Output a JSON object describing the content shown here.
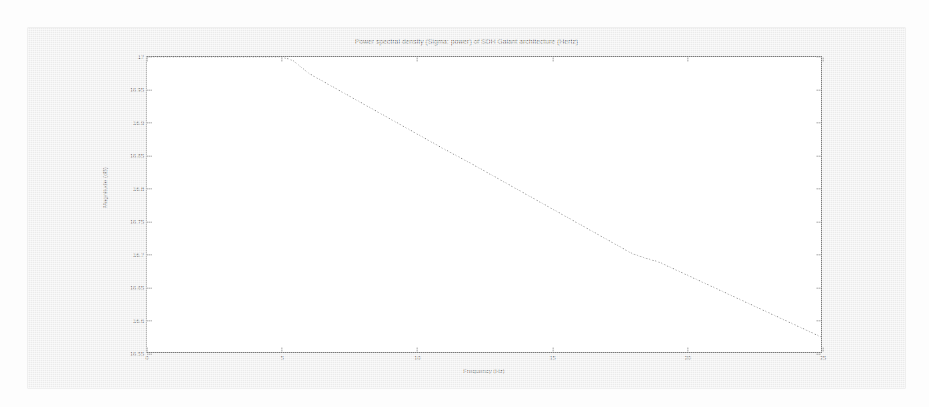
{
  "window": {
    "background_color": "#ffffff",
    "figure_background_color": "#ebebeb",
    "axes_background_color": "#ffffff",
    "axes_border_color": "#7a7a7a"
  },
  "chart_data": {
    "type": "line",
    "title": "Power spectral density (Sigma: power) of SDH Gaiant architecture (Hertz)",
    "xlabel": "Frequency (Hz)",
    "ylabel": "Magnitude (dB)",
    "xlim": [
      0,
      25
    ],
    "ylim": [
      16.55,
      17.0
    ],
    "xticks": [
      0,
      5,
      10,
      15,
      20,
      25
    ],
    "xticklabels": [
      "0",
      "5",
      "10",
      "15",
      "20",
      "25"
    ],
    "yticks": [
      17,
      16.95,
      16.9,
      16.85,
      16.8,
      16.75,
      16.7,
      16.65,
      16.6,
      16.55
    ],
    "yticklabels": [
      "17",
      "16.95",
      "16.9",
      "16.85",
      "16.8",
      "16.75",
      "16.7",
      "16.65",
      "16.6",
      "16.55"
    ],
    "grid": false,
    "legend": null,
    "line_color": "#6b6b6b",
    "line_style": "dotted",
    "series": [
      {
        "name": "power spectral density",
        "x": [
          0,
          1,
          2,
          3,
          4,
          5,
          5.4,
          6,
          7,
          8,
          9,
          10,
          11,
          12,
          13,
          14,
          15,
          16,
          17,
          18,
          18.5,
          19,
          20,
          21,
          22,
          23,
          24,
          25
        ],
        "y": [
          17.0,
          17.0,
          17.0,
          17.0,
          17.0,
          17.0,
          16.995,
          16.975,
          16.952,
          16.929,
          16.906,
          16.883,
          16.86,
          16.838,
          16.815,
          16.792,
          16.769,
          16.746,
          16.723,
          16.7,
          16.693,
          16.687,
          16.668,
          16.649,
          16.63,
          16.611,
          16.592,
          16.573
        ]
      }
    ]
  }
}
